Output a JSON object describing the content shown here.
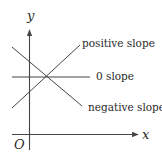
{
  "diagram": {
    "type": "slope-illustration",
    "axes": {
      "x_label": "x",
      "y_label": "y",
      "origin_label": "O"
    },
    "lines": [
      {
        "name": "positive-slope-line",
        "label": "positive slope"
      },
      {
        "name": "zero-slope-line",
        "label": "0 slope"
      },
      {
        "name": "negative-slope-line",
        "label": "negative slope"
      }
    ],
    "colors": {
      "line": "#444444",
      "text": "#2a2a2a",
      "background": "#ffffff"
    }
  }
}
